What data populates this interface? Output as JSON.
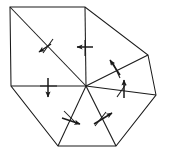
{
  "figure": {
    "canvas": {
      "width": 169,
      "height": 159,
      "background": "#ffffff"
    },
    "stroke_color": "#1a1a1a",
    "line_width": 1.05
  },
  "chart_data": {
    "type": "diagram",
    "title": "",
    "vertices": [
      {
        "id": "v-top-left",
        "label": "A",
        "x": 10,
        "y": 7
      },
      {
        "id": "v-top-right",
        "label": "B",
        "x": 85,
        "y": 7
      },
      {
        "id": "v-right-upper",
        "label": "C",
        "x": 148,
        "y": 55
      },
      {
        "id": "v-right-lower",
        "label": "D",
        "x": 156,
        "y": 95
      },
      {
        "id": "v-bottom-right",
        "label": "E",
        "x": 116,
        "y": 146
      },
      {
        "id": "v-bottom-left",
        "label": "F",
        "x": 58,
        "y": 146
      },
      {
        "id": "v-left",
        "label": "G",
        "x": 11,
        "y": 86
      },
      {
        "id": "v-hub",
        "label": "O",
        "x": 86,
        "y": 86
      }
    ],
    "outline_path": [
      "v-top-left",
      "v-top-right",
      "v-right-upper",
      "v-right-lower",
      "v-bottom-right",
      "v-bottom-left",
      "v-left"
    ],
    "spokes": [
      {
        "id": "spoke-hub-to-top-left",
        "from": "v-hub",
        "to": "v-top-left"
      },
      {
        "id": "spoke-hub-to-top-right",
        "from": "v-hub",
        "to": "v-top-right"
      },
      {
        "id": "spoke-hub-to-right-upper",
        "from": "v-hub",
        "to": "v-right-upper"
      },
      {
        "id": "spoke-hub-to-right-lower",
        "from": "v-hub",
        "to": "v-right-lower"
      },
      {
        "id": "spoke-hub-to-bottom-right",
        "from": "v-hub",
        "to": "v-bottom-right"
      },
      {
        "id": "spoke-hub-to-bottom-left",
        "from": "v-hub",
        "to": "v-bottom-left"
      },
      {
        "id": "spoke-hub-to-left",
        "from": "v-hub",
        "to": "v-left"
      }
    ],
    "annotations": [
      {
        "id": "arrow-upper-left-diagonal",
        "name": "direction-arrow-down-left",
        "on_edge": "spoke-hub-to-top-left",
        "tick": {
          "x1": 53,
          "y1": 39,
          "x2": 43,
          "y2": 53
        },
        "arrow": {
          "x1": 51,
          "y1": 44,
          "x2": 39,
          "y2": 52
        },
        "direction_deg": 214
      },
      {
        "id": "arrow-top-vertical",
        "name": "direction-arrow-left",
        "on_edge": "spoke-hub-to-top-right",
        "tick": {
          "x1": 85,
          "y1": 40,
          "x2": 85,
          "y2": 56
        },
        "arrow": {
          "x1": 93,
          "y1": 47,
          "x2": 77,
          "y2": 47
        },
        "direction_deg": 180
      },
      {
        "id": "arrow-left-horizontal",
        "name": "direction-arrow-down",
        "on_edge": "spoke-hub-to-left",
        "tick": {
          "x1": 40,
          "y1": 86,
          "x2": 57,
          "y2": 86
        },
        "arrow": {
          "x1": 48,
          "y1": 78,
          "x2": 48,
          "y2": 97
        },
        "direction_deg": 270
      },
      {
        "id": "arrow-right-upper-diagonal",
        "name": "direction-arrow-up-left",
        "on_edge": "spoke-hub-to-right-upper",
        "tick": {
          "x1": 113,
          "y1": 63,
          "x2": 120,
          "y2": 78
        },
        "arrow": {
          "x1": 120,
          "y1": 75,
          "x2": 110,
          "y2": 60
        },
        "direction_deg": 124
      },
      {
        "id": "arrow-right-lower-diagonal",
        "name": "direction-arrow-up",
        "on_edge": "spoke-hub-to-right-lower",
        "tick": {
          "x1": 117,
          "y1": 97,
          "x2": 126,
          "y2": 84
        },
        "arrow": {
          "x1": 124,
          "y1": 98,
          "x2": 124,
          "y2": 80
        },
        "direction_deg": 90
      },
      {
        "id": "arrow-bottom-left-diagonal",
        "name": "direction-arrow-right-down",
        "on_edge": "spoke-hub-to-bottom-left",
        "tick": {
          "x1": 64,
          "y1": 111,
          "x2": 77,
          "y2": 124
        },
        "arrow": {
          "x1": 62,
          "y1": 118,
          "x2": 80,
          "y2": 124
        },
        "direction_deg": 342
      },
      {
        "id": "arrow-bottom-right-diagonal",
        "name": "direction-arrow-up-right",
        "on_edge": "spoke-hub-to-bottom-right",
        "tick": {
          "x1": 95,
          "y1": 126,
          "x2": 106,
          "y2": 112
        },
        "arrow": {
          "x1": 94,
          "y1": 124,
          "x2": 112,
          "y2": 113
        },
        "direction_deg": 30
      }
    ]
  }
}
